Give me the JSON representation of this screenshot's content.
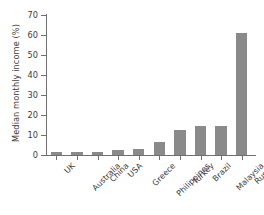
{
  "chart_data": {
    "type": "bar",
    "title": "",
    "subtitle": "",
    "xlabel": "",
    "ylabel": "Median monthly income (%)",
    "categories": [
      "UK",
      "Australia",
      "China",
      "USA",
      "Greece",
      "Philippines",
      "Turkey",
      "Brazil",
      "Malaysia",
      "Russia"
    ],
    "values": [
      1.5,
      1.7,
      1.7,
      2.5,
      3.0,
      6.3,
      12.5,
      14.3,
      14.5,
      61.0
    ],
    "ylim": [
      0,
      70
    ],
    "yticks": [
      0,
      10,
      20,
      30,
      40,
      50,
      60,
      70
    ],
    "ytick_labels": [
      "0",
      "10",
      "20",
      "30",
      "40",
      "50",
      "60",
      "70"
    ],
    "grid": false,
    "legend": false,
    "legend_position": "none",
    "bar_color": "#8a8a8a",
    "axis_color": "#6f6f6f",
    "background": "#ffffff"
  }
}
